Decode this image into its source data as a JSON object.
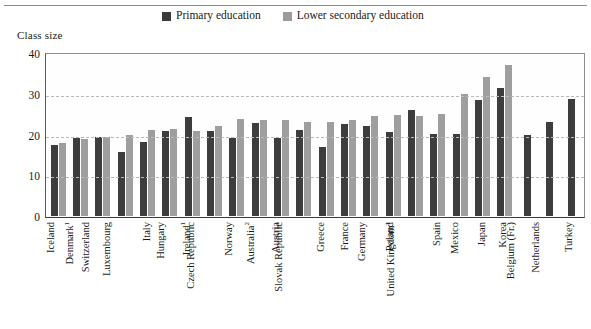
{
  "chart_data": {
    "type": "bar",
    "title": "",
    "ylabel": "Class size",
    "xlabel": "",
    "ylim": [
      0,
      40
    ],
    "yticks": [
      0,
      10,
      20,
      30,
      40
    ],
    "grid": true,
    "legend_position": "top",
    "categories": [
      "Iceland",
      "Denmark1",
      "Switzerland",
      "Luxembourg",
      "Italy",
      "Hungary",
      "Ireland1",
      "Czech Republic",
      "Norway",
      "Australia2",
      "Austria",
      "Slovak Republic",
      "Greece",
      "France",
      "Germany",
      "Poland",
      "United Kingdom1",
      "Spain",
      "Mexico",
      "Japan",
      "Korea",
      "Belgium (Fr.)",
      "Netherlands",
      "Turkey"
    ],
    "series": [
      {
        "name": "Primary education",
        "color": "#3d3d3d",
        "values": [
          17.4,
          19.2,
          19.5,
          15.8,
          18.2,
          20.9,
          24.3,
          20.9,
          19.2,
          22.9,
          19.2,
          21.1,
          17.0,
          22.5,
          22.0,
          20.5,
          26.0,
          20.2,
          20.2,
          28.4,
          31.4,
          19.8,
          23.1,
          28.8
        ]
      },
      {
        "name": "Lower secondary education",
        "color": "#9e9e9e",
        "values": [
          17.9,
          18.8,
          19.5,
          19.8,
          21.2,
          21.4,
          20.8,
          22.0,
          23.8,
          23.6,
          23.6,
          23.0,
          23.0,
          23.6,
          24.6,
          24.8,
          24.6,
          25.0,
          30.0,
          34.0,
          37.1,
          null,
          null,
          null
        ]
      }
    ]
  },
  "legend": {
    "items": [
      {
        "label": "Primary education",
        "swatch": "primary-swatch"
      },
      {
        "label": "Lower secondary education",
        "swatch": "secondary-swatch"
      }
    ]
  },
  "axis": {
    "y_title": "Class size",
    "y_labels": [
      "40",
      "30",
      "20",
      "10",
      "0"
    ]
  },
  "x_labels": [
    {
      "name": "Iceland",
      "note": ""
    },
    {
      "name": "Denmark",
      "note": "1"
    },
    {
      "name": "Switzerland",
      "note": ""
    },
    {
      "name": "Luxembourg",
      "note": ""
    },
    {
      "name": "Italy",
      "note": ""
    },
    {
      "name": "Hungary",
      "note": ""
    },
    {
      "name": "Ireland",
      "note": "1"
    },
    {
      "name": "Czech Republic",
      "note": ""
    },
    {
      "name": "Norway",
      "note": ""
    },
    {
      "name": "Australia",
      "note": "2"
    },
    {
      "name": "Austria",
      "note": ""
    },
    {
      "name": "Slovak Republic",
      "note": ""
    },
    {
      "name": "Greece",
      "note": ""
    },
    {
      "name": "France",
      "note": ""
    },
    {
      "name": "Germany",
      "note": ""
    },
    {
      "name": "Poland",
      "note": ""
    },
    {
      "name": "United Kingdom",
      "note": "1"
    },
    {
      "name": "Spain",
      "note": ""
    },
    {
      "name": "Mexico",
      "note": ""
    },
    {
      "name": "Japan",
      "note": ""
    },
    {
      "name": "Korea",
      "note": ""
    },
    {
      "name": "Belgium (Fr.)",
      "note": ""
    },
    {
      "name": "Netherlands",
      "note": ""
    },
    {
      "name": "Turkey",
      "note": ""
    }
  ],
  "colors": {
    "primary_series": "#3d3d3d",
    "secondary_series": "#9e9e9e",
    "gridline": "#b9b9b9",
    "frame": "#5a5a5a"
  }
}
